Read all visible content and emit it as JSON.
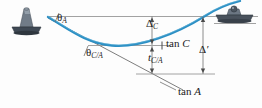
{
  "figure": {
    "type": "beam-deflection-diagram",
    "colors": {
      "elastic_curve": "#2b8fc4",
      "construction_line": "#6e6e6e",
      "support_body": "#5a6672",
      "support_base": "#3c4650",
      "text": "#1a1a1a",
      "background": "#fdfdfd"
    },
    "labels": {
      "theta_a": {
        "greek": "θ",
        "sub": "A"
      },
      "theta_ca": {
        "greek": "θ",
        "sub": "C/A"
      },
      "delta_c": {
        "greek": "Δ",
        "sub": "C"
      },
      "tan_c": {
        "text": "tan",
        "italic": "C"
      },
      "t_ca": {
        "base": "t",
        "sub": "C/A"
      },
      "delta_prime": {
        "greek": "Δ",
        "prime": "′"
      },
      "tan_a": {
        "text": "tan",
        "italic": "A"
      }
    },
    "elements": {
      "pin_support": "pin-support-a",
      "roller_support": "roller-support-b",
      "elastic_curve": "elastic-curve",
      "reference_horizontal": "horizontal-reference-line",
      "tangent_a_line": "tangent-at-a-line",
      "tangent_c_line": "tangent-at-c-line",
      "dimension_delta_c": "delta-c-dimension",
      "dimension_t_ca": "t-ca-dimension",
      "dimension_delta_prime": "delta-prime-dimension"
    }
  }
}
